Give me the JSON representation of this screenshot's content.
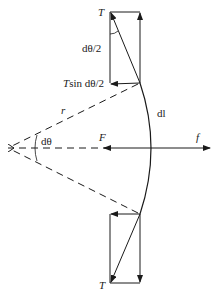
{
  "diagram": {
    "title": "",
    "labels": {
      "tension_top": "T",
      "half_angle": "dθ/2",
      "tsin_prefix": "T",
      "tsin_rest": "sin dθ/2",
      "radius": "r",
      "arc_length": "dl",
      "angle": "dθ",
      "force_F": "F",
      "force_f": "f",
      "tension_bottom": "T"
    },
    "colors": {
      "stroke": "#1a1a1a",
      "background": "#ffffff"
    }
  }
}
